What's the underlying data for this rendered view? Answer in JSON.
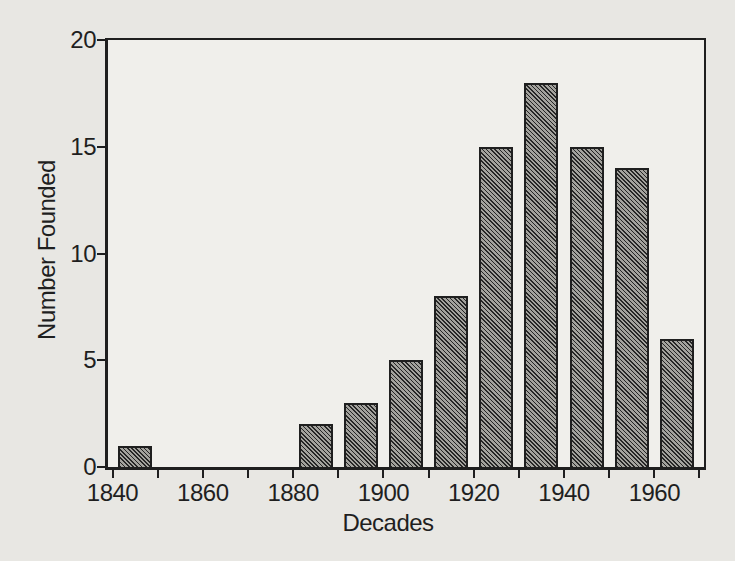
{
  "figure": {
    "background": "#e8e7e3",
    "plot_background": "#f0efeb",
    "ink": "#1f1f1f"
  },
  "chart_data": {
    "type": "bar",
    "title": "",
    "xlabel": "Decades",
    "ylabel": "Number Founded",
    "categories": [
      1845,
      1855,
      1865,
      1875,
      1885,
      1895,
      1905,
      1915,
      1925,
      1935,
      1945,
      1955,
      1965
    ],
    "values": [
      1,
      0,
      0,
      0,
      2,
      3,
      5,
      8,
      15,
      18,
      15,
      14,
      6
    ],
    "bar_width_years": 7.5,
    "xlim": [
      1839,
      1971
    ],
    "ylim": [
      0,
      20
    ],
    "x_major_ticks": [
      1840,
      1860,
      1880,
      1900,
      1920,
      1940,
      1960
    ],
    "x_minor_ticks": [
      1850,
      1870,
      1890,
      1910,
      1930,
      1950,
      1970
    ],
    "y_ticks": [
      0,
      5,
      10,
      15,
      20
    ],
    "grid": false,
    "legend": null,
    "bar_fill": "#a3a29d",
    "bar_hatch": "\\",
    "bar_hatch_color": "#262626",
    "bar_edge_color": "#1f1f1f"
  }
}
